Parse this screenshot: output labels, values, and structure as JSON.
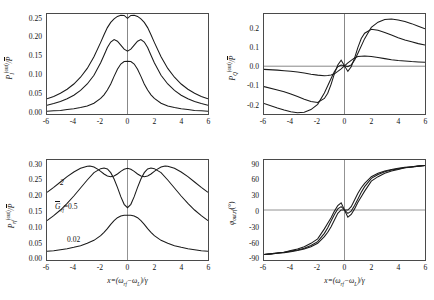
{
  "figure": {
    "panel_count": 4,
    "curve_labels": [
      "2",
      "0.5",
      "0.02"
    ],
    "param_label": "Ḡrf=0.5",
    "param_label_plain": "Grf",
    "annot_top": "2",
    "annot_mid_value": "=0.5",
    "annot_bottom": "0.02"
  },
  "axes": {
    "xlabel": "x=(ωrf−ωL)/γ",
    "xticks": [
      "-6",
      "-4",
      "-2",
      "0",
      "2",
      "4",
      "6"
    ],
    "xlim": [
      -6,
      6
    ]
  },
  "chart_data": [
    {
      "type": "line",
      "panel": "top-left",
      "title": "",
      "xlabel": "x=(ωrf−ωL)/γ",
      "ylabel": "PI(out)/P̄",
      "xlim": [
        -6,
        6
      ],
      "ylim": [
        0.0,
        0.25
      ],
      "xticks": [
        -6,
        -4,
        -2,
        0,
        2,
        4,
        6
      ],
      "yticks": [
        0.0,
        0.05,
        0.1,
        0.15,
        0.2,
        0.25
      ],
      "ytick_labels": [
        "0.00",
        "0.05",
        "0.10",
        "0.15",
        "0.20",
        "0.25"
      ],
      "grid": false,
      "legend": "none",
      "series": [
        {
          "name": "2",
          "x": [
            -6,
            -5.5,
            -5,
            -4.5,
            -4,
            -3.5,
            -3,
            -2.5,
            -2,
            -1.75,
            -1.5,
            -1.25,
            -1,
            -0.75,
            -0.5,
            -0.25,
            0,
            0.25,
            0.5,
            0.75,
            1,
            1.25,
            1.5,
            1.75,
            2,
            2.5,
            3,
            3.5,
            4,
            4.5,
            5,
            5.5,
            6
          ],
          "values": [
            0.038,
            0.044,
            0.052,
            0.062,
            0.075,
            0.092,
            0.114,
            0.143,
            0.179,
            0.198,
            0.216,
            0.229,
            0.238,
            0.244,
            0.247,
            0.2465,
            0.239,
            0.2465,
            0.247,
            0.244,
            0.238,
            0.229,
            0.216,
            0.198,
            0.179,
            0.143,
            0.114,
            0.092,
            0.075,
            0.062,
            0.052,
            0.044,
            0.038
          ]
        },
        {
          "name": "0.5",
          "x": [
            -6,
            -5.5,
            -5,
            -4.5,
            -4,
            -3.5,
            -3,
            -2.5,
            -2,
            -1.75,
            -1.5,
            -1.25,
            -1,
            -0.75,
            -0.5,
            -0.25,
            0,
            0.25,
            0.5,
            0.75,
            1,
            1.25,
            1.5,
            1.75,
            2,
            2.5,
            3,
            3.5,
            4,
            4.5,
            5,
            5.5,
            6
          ],
          "values": [
            0.022,
            0.026,
            0.031,
            0.038,
            0.047,
            0.059,
            0.075,
            0.097,
            0.128,
            0.147,
            0.166,
            0.18,
            0.186,
            0.182,
            0.172,
            0.162,
            0.157,
            0.162,
            0.172,
            0.182,
            0.186,
            0.18,
            0.166,
            0.147,
            0.128,
            0.097,
            0.075,
            0.059,
            0.047,
            0.038,
            0.031,
            0.026,
            0.022
          ]
        },
        {
          "name": "0.02",
          "x": [
            -6,
            -5.5,
            -5,
            -4.5,
            -4,
            -3.5,
            -3,
            -2.5,
            -2,
            -1.75,
            -1.5,
            -1.25,
            -1,
            -0.75,
            -0.5,
            -0.25,
            0,
            0.25,
            0.5,
            0.75,
            1,
            1.25,
            1.5,
            1.75,
            2,
            2.5,
            3,
            3.5,
            4,
            4.5,
            5,
            5.5,
            6
          ],
          "values": [
            0.007,
            0.008,
            0.009,
            0.011,
            0.013,
            0.016,
            0.02,
            0.027,
            0.039,
            0.048,
            0.06,
            0.075,
            0.094,
            0.112,
            0.125,
            0.131,
            0.132,
            0.131,
            0.125,
            0.112,
            0.094,
            0.075,
            0.06,
            0.048,
            0.039,
            0.027,
            0.02,
            0.016,
            0.013,
            0.011,
            0.009,
            0.008,
            0.007
          ]
        }
      ]
    },
    {
      "type": "line",
      "panel": "top-right",
      "title": "",
      "xlabel": "x=(ωrf−ωL)/γ",
      "ylabel": "PQ(out)/P̄",
      "xlim": [
        -6,
        6
      ],
      "ylim": [
        -0.26,
        0.28
      ],
      "xticks": [
        -6,
        -4,
        -2,
        0,
        2,
        4,
        6
      ],
      "yticks": [
        -0.2,
        -0.1,
        0.0,
        0.1,
        0.2
      ],
      "ytick_labels": [
        "-0.2",
        "-0.1",
        "0.0",
        "0.1",
        "0.2"
      ],
      "grid": false,
      "legend": "none",
      "series": [
        {
          "name": "2",
          "x": [
            -6,
            -5,
            -4.5,
            -4,
            -3.5,
            -3,
            -2.5,
            -2,
            -1.5,
            -1,
            -0.75,
            -0.5,
            -0.25,
            0,
            0.25,
            0.5,
            0.75,
            1,
            1.5,
            2,
            2.5,
            3,
            3.5,
            4,
            4.5,
            5,
            5.5,
            6
          ],
          "values": [
            -0.203,
            -0.228,
            -0.239,
            -0.248,
            -0.253,
            -0.25,
            -0.236,
            -0.208,
            -0.147,
            -0.068,
            -0.03,
            -0.005,
            0.004,
            0.0,
            -0.004,
            0.005,
            0.03,
            0.068,
            0.147,
            0.208,
            0.236,
            0.25,
            0.253,
            0.248,
            0.239,
            0.228,
            0.214,
            0.2
          ]
        },
        {
          "name": "0.5",
          "x": [
            -6,
            -5,
            -4.5,
            -4,
            -3.5,
            -3,
            -2.5,
            -2,
            -1.5,
            -1.25,
            -1,
            -0.75,
            -0.5,
            -0.25,
            0,
            0.25,
            0.5,
            0.75,
            1,
            1.25,
            1.5,
            2,
            2.5,
            3,
            3.5,
            4,
            4.5,
            5,
            5.5,
            6
          ],
          "values": [
            -0.112,
            -0.13,
            -0.14,
            -0.152,
            -0.166,
            -0.18,
            -0.192,
            -0.198,
            -0.176,
            -0.148,
            -0.1,
            -0.042,
            0.005,
            0.03,
            0.0,
            -0.03,
            -0.005,
            0.042,
            0.1,
            0.148,
            0.176,
            0.198,
            0.192,
            0.18,
            0.166,
            0.152,
            0.14,
            0.13,
            0.12,
            0.112
          ]
        },
        {
          "name": "0.02",
          "x": [
            -6,
            -5,
            -4.5,
            -4,
            -3.5,
            -3,
            -2.5,
            -2,
            -1.5,
            -1.25,
            -1,
            -0.75,
            -0.5,
            -0.25,
            0,
            0.25,
            0.5,
            0.75,
            1,
            1.25,
            1.5,
            2,
            2.5,
            3,
            3.5,
            4,
            4.5,
            5,
            5.5,
            6
          ],
          "values": [
            -0.019,
            -0.023,
            -0.026,
            -0.029,
            -0.033,
            -0.039,
            -0.045,
            -0.05,
            -0.053,
            -0.052,
            -0.05,
            -0.043,
            -0.03,
            -0.016,
            0.0,
            0.016,
            0.03,
            0.043,
            0.05,
            0.052,
            0.053,
            0.05,
            0.045,
            0.039,
            0.033,
            0.029,
            0.026,
            0.023,
            0.021,
            0.019
          ]
        }
      ]
    },
    {
      "type": "line",
      "panel": "bottom-left",
      "title": "",
      "xlabel": "x=(ωrf−ωL)/γ",
      "ylabel": "Prf(out)/P̄",
      "xlim": [
        -6,
        6
      ],
      "ylim": [
        0.0,
        0.3
      ],
      "xticks": [
        -6,
        -4,
        -2,
        0,
        2,
        4,
        6
      ],
      "yticks": [
        0.0,
        0.05,
        0.1,
        0.15,
        0.2,
        0.25,
        0.3
      ],
      "ytick_labels": [
        "0.00",
        "0.05",
        "0.10",
        "0.15",
        "0.20",
        "0.25",
        "0.30"
      ],
      "grid": false,
      "legend": "inline-annotations",
      "annotations": [
        {
          "text": "2",
          "x": -3.9,
          "y": 0.237
        },
        {
          "text": "Ḡrf=0.5",
          "x": -2.6,
          "y": 0.168
        },
        {
          "text": "0.02",
          "x": -1.9,
          "y": 0.052
        }
      ],
      "series": [
        {
          "name": "2",
          "x": [
            -6,
            -5.5,
            -5,
            -4.5,
            -4,
            -3.5,
            -3,
            -2.8,
            -2.5,
            -2.2,
            -2,
            -1.75,
            -1.5,
            -1.25,
            -1,
            -0.75,
            -0.5,
            -0.25,
            0,
            0.25,
            0.5,
            0.75,
            1,
            1.25,
            1.5,
            1.75,
            2,
            2.2,
            2.5,
            2.8,
            3,
            3.5,
            4,
            4.5,
            5,
            5.5,
            6
          ],
          "values": [
            0.203,
            0.218,
            0.234,
            0.25,
            0.264,
            0.275,
            0.281,
            0.282,
            0.279,
            0.272,
            0.266,
            0.258,
            0.252,
            0.25,
            0.252,
            0.258,
            0.266,
            0.272,
            0.275,
            0.272,
            0.266,
            0.258,
            0.252,
            0.25,
            0.252,
            0.258,
            0.266,
            0.272,
            0.279,
            0.282,
            0.281,
            0.275,
            0.264,
            0.25,
            0.234,
            0.218,
            0.203
          ]
        },
        {
          "name": "0.5",
          "x": [
            -6,
            -5.5,
            -5,
            -4.5,
            -4,
            -3.5,
            -3,
            -2.5,
            -2,
            -1.75,
            -1.5,
            -1.25,
            -1,
            -0.75,
            -0.5,
            -0.25,
            0,
            0.25,
            0.5,
            0.75,
            1,
            1.25,
            1.5,
            1.75,
            2,
            2.5,
            3,
            3.5,
            4,
            4.5,
            5,
            5.5,
            6
          ],
          "values": [
            0.118,
            0.133,
            0.15,
            0.17,
            0.192,
            0.216,
            0.24,
            0.262,
            0.274,
            0.276,
            0.273,
            0.262,
            0.243,
            0.218,
            0.19,
            0.167,
            0.157,
            0.167,
            0.19,
            0.218,
            0.243,
            0.262,
            0.273,
            0.276,
            0.274,
            0.262,
            0.24,
            0.216,
            0.192,
            0.17,
            0.15,
            0.133,
            0.118
          ]
        },
        {
          "name": "0.02",
          "x": [
            -6,
            -5.5,
            -5,
            -4.5,
            -4,
            -3.5,
            -3,
            -2.5,
            -2,
            -1.75,
            -1.5,
            -1.25,
            -1,
            -0.75,
            -0.5,
            -0.25,
            0,
            0.25,
            0.5,
            0.75,
            1,
            1.25,
            1.5,
            1.75,
            2,
            2.5,
            3,
            3.5,
            4,
            4.5,
            5,
            5.5,
            6
          ],
          "values": [
            0.026,
            0.028,
            0.031,
            0.034,
            0.038,
            0.043,
            0.05,
            0.059,
            0.073,
            0.083,
            0.094,
            0.107,
            0.118,
            0.127,
            0.132,
            0.134,
            0.134,
            0.134,
            0.132,
            0.127,
            0.118,
            0.107,
            0.094,
            0.083,
            0.073,
            0.059,
            0.05,
            0.043,
            0.038,
            0.034,
            0.031,
            0.028,
            0.026
          ]
        }
      ]
    },
    {
      "type": "line",
      "panel": "bottom-right",
      "title": "",
      "xlabel": "x=(ωrf−ωL)/γ",
      "ylabel": "φout,rf(°)",
      "xlim": [
        -6,
        6
      ],
      "ylim": [
        -90,
        90
      ],
      "xticks": [
        -6,
        -4,
        -2,
        0,
        2,
        4,
        6
      ],
      "yticks": [
        -90,
        -60,
        -30,
        0,
        30,
        60,
        90
      ],
      "ytick_labels": [
        "-90",
        "-60",
        "-30",
        "0",
        "30",
        "60",
        "90"
      ],
      "grid": false,
      "legend": "none",
      "series": [
        {
          "name": "2",
          "x": [
            -6,
            -5.5,
            -5,
            -4.5,
            -4,
            -3.5,
            -3,
            -2.5,
            -2,
            -1.5,
            -1.25,
            -1,
            -0.75,
            -0.5,
            -0.25,
            0,
            0.25,
            0.5,
            0.75,
            1,
            1.25,
            1.5,
            2,
            2.5,
            3,
            3.5,
            4,
            4.5,
            5,
            5.5,
            6
          ],
          "values": [
            -80,
            -79,
            -78,
            -77,
            -75,
            -73,
            -70,
            -66,
            -60,
            -48,
            -40,
            -30,
            -18,
            -6,
            0,
            0,
            0,
            6,
            18,
            30,
            40,
            48,
            60,
            66,
            70,
            73,
            75,
            77,
            78,
            79,
            80
          ]
        },
        {
          "name": "0.5",
          "x": [
            -6,
            -5.5,
            -5,
            -4.5,
            -4,
            -3.5,
            -3,
            -2.5,
            -2,
            -1.5,
            -1.25,
            -1,
            -0.75,
            -0.5,
            -0.25,
            0,
            0.25,
            0.5,
            0.75,
            1,
            1.25,
            1.5,
            2,
            2.5,
            3,
            3.5,
            4,
            4.5,
            5,
            5.5,
            6
          ],
          "values": [
            -80,
            -79,
            -78,
            -76,
            -74,
            -72,
            -69,
            -64,
            -57,
            -42,
            -32,
            -20,
            -8,
            2,
            6,
            0,
            -6,
            -2,
            8,
            20,
            32,
            42,
            57,
            64,
            69,
            72,
            74,
            76,
            78,
            79,
            80
          ]
        },
        {
          "name": "0.02",
          "x": [
            -6,
            -5.5,
            -5,
            -4.5,
            -4,
            -3.5,
            -3,
            -2.5,
            -2,
            -1.5,
            -1.25,
            -1,
            -0.75,
            -0.5,
            -0.25,
            0,
            0.25,
            0.5,
            0.75,
            1,
            1.25,
            1.5,
            2,
            2.5,
            3,
            3.5,
            4,
            4.5,
            5,
            5.5,
            6
          ],
          "values": [
            -80,
            -79,
            -77,
            -76,
            -73,
            -70,
            -66,
            -60,
            -52,
            -34,
            -24,
            -14,
            -2,
            8,
            13,
            0,
            -13,
            -8,
            2,
            14,
            24,
            34,
            52,
            60,
            66,
            70,
            73,
            76,
            77,
            79,
            80
          ]
        }
      ]
    }
  ]
}
